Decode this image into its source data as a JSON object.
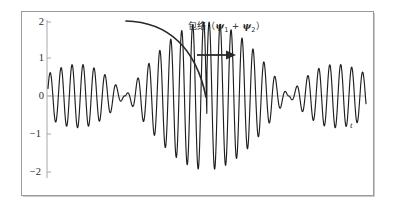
{
  "figure": {
    "frame": {
      "x": 21,
      "y": 11,
      "width": 353,
      "height": 185
    },
    "background_color": "#ffffff",
    "frame_color": "#9b9b9b"
  },
  "annotation": {
    "label_prefix": "包络（",
    "psi": "ψ",
    "sub1": "1",
    "plus": " + ",
    "sub2": "2",
    "label_suffix": "）",
    "full_text": "包络（ψ1 + ψ2）",
    "curved_arrow_name": "envelope-pointer-curve",
    "straight_arrow_name": "envelope-pointer-arrow",
    "color": "#262626"
  },
  "axis": {
    "time_label": "t",
    "zero_line_color": "#b9b9b9",
    "axis_color": "#9a9a9a",
    "y_ticks": [
      {
        "label": "2",
        "value": 2,
        "y": 22
      },
      {
        "label": "1",
        "value": 1,
        "y": 58
      },
      {
        "label": "0",
        "value": 0,
        "y": 96
      },
      {
        "label": "−1",
        "value": -1,
        "y": 134
      },
      {
        "label": "−2",
        "value": -2,
        "y": 172
      }
    ]
  },
  "chart_data": {
    "type": "line",
    "title": "",
    "subtitle": "",
    "xlabel": "t",
    "ylabel": "",
    "xlim": [
      0,
      1
    ],
    "ylim": [
      -2,
      2
    ],
    "grid": false,
    "legend": "none",
    "annotations": [
      {
        "text": "包络（ψ1 + ψ2）",
        "meaning": "envelope (psi_1 + psi_2)",
        "x_px": 188,
        "y_px": 19
      }
    ],
    "series": [
      {
        "name": "psi1 + psi2",
        "color": "#1f1f1f",
        "line_width": 1.1,
        "model": {
          "formula": "y = 2*cos(pi*(x-0.5)/0.52)*sin(2*pi*f*x + phase)",
          "envelope_amplitude": 2,
          "carrier_cycles": 29,
          "beat_node_x": 0.5,
          "samples": 1600
        }
      }
    ],
    "envelope": {
      "amplitude_max": 2,
      "node_count": 1,
      "node_position_fraction": 0.5
    }
  }
}
